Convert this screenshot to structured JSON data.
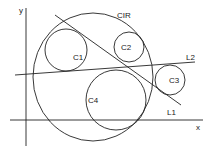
{
  "diagram": {
    "stroke_color": "#222222",
    "background": "#ffffff",
    "axes": {
      "x_label": "x",
      "y_label": "y"
    },
    "circles": [
      {
        "id": "CIR",
        "label": "CIR"
      },
      {
        "id": "C1",
        "label": "C1"
      },
      {
        "id": "C2",
        "label": "C2"
      },
      {
        "id": "C3",
        "label": "C3"
      },
      {
        "id": "C4",
        "label": "C4"
      }
    ],
    "lines": [
      {
        "id": "L1",
        "label": "L1"
      },
      {
        "id": "L2",
        "label": "L2"
      }
    ]
  }
}
